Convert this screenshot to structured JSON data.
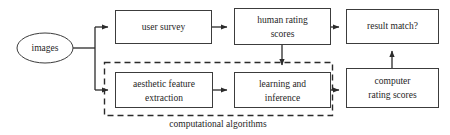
{
  "diagram": {
    "nodes": {
      "images": {
        "label": "images",
        "shape": "ellipse"
      },
      "user_survey": {
        "label": "user survey",
        "shape": "rectangle"
      },
      "human_rating_scores": {
        "label_line1": "human rating",
        "label_line2": "scores",
        "shape": "rectangle"
      },
      "result_match": {
        "label": "result match?",
        "shape": "rectangle"
      },
      "aesthetic_feature_extraction": {
        "label_line1": "aesthetic feature",
        "label_line2": "extraction",
        "shape": "rectangle"
      },
      "learning_and_inference": {
        "label_line1": "learning and",
        "label_line2": "inference",
        "shape": "rectangle"
      },
      "computer_rating_scores": {
        "label_line1": "computer",
        "label_line2": "rating scores",
        "shape": "rectangle"
      }
    },
    "group": {
      "caption": "computational algorithms",
      "style": "dashed"
    },
    "colors": {
      "stroke": "#3c3c3c",
      "text": "#262626",
      "background": "#ffffff",
      "edge": "#2b2b2b"
    },
    "edges": [
      {
        "from": "images",
        "to": "user_survey"
      },
      {
        "from": "images",
        "to": "aesthetic_feature_extraction"
      },
      {
        "from": "user_survey",
        "to": "human_rating_scores"
      },
      {
        "from": "human_rating_scores",
        "to": "result_match"
      },
      {
        "from": "human_rating_scores",
        "to": "learning_and_inference"
      },
      {
        "from": "aesthetic_feature_extraction",
        "to": "learning_and_inference"
      },
      {
        "from": "learning_and_inference",
        "to": "computer_rating_scores"
      },
      {
        "from": "computer_rating_scores",
        "to": "result_match"
      }
    ]
  }
}
